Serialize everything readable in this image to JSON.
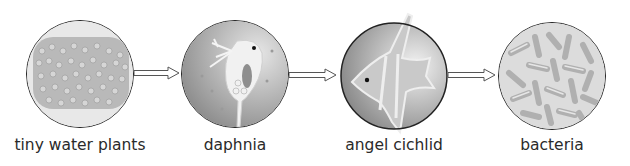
{
  "diagram": {
    "type": "food-chain",
    "nodes": [
      {
        "id": "tiny-water-plants",
        "label": "tiny water plants",
        "icon": "algae-cells-icon"
      },
      {
        "id": "daphnia",
        "label": "daphnia",
        "icon": "daphnia-icon"
      },
      {
        "id": "angel-cichlid",
        "label": "angel cichlid",
        "icon": "angelfish-icon"
      },
      {
        "id": "bacteria",
        "label": "bacteria",
        "icon": "bacteria-icon"
      }
    ],
    "edges": [
      {
        "from": "tiny-water-plants",
        "to": "daphnia"
      },
      {
        "from": "daphnia",
        "to": "angel-cichlid"
      },
      {
        "from": "angel-cichlid",
        "to": "bacteria"
      }
    ]
  }
}
